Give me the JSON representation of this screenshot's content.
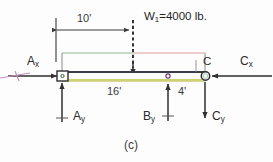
{
  "figure": {
    "caption": "(c)",
    "background_color": "#fdfdfd"
  },
  "dimensions": [
    {
      "id": "span-10",
      "label": "10'",
      "value": 10,
      "unit": "ft",
      "description": "distance from left support A to applied load W1"
    },
    {
      "id": "span-16",
      "label": "16'",
      "value": 16,
      "unit": "ft",
      "description": "distance from left support A to support B"
    },
    {
      "id": "span-4",
      "label": "4'",
      "value": 4,
      "unit": "ft",
      "description": "distance from support B to joint C"
    }
  ],
  "loads": [
    {
      "id": "W1",
      "label": "W",
      "subscript": "1",
      "equals": "=4000 lb.",
      "full_label": "W1=4000 lb.",
      "magnitude": 4000,
      "unit": "lb",
      "direction": "down",
      "line_style": "dashed"
    }
  ],
  "reactions": [
    {
      "id": "Ax",
      "label": "A",
      "subscript": "x",
      "direction": "right",
      "at": "A"
    },
    {
      "id": "Ay",
      "label": "A",
      "subscript": "y",
      "direction": "up",
      "at": "A"
    },
    {
      "id": "By",
      "label": "B",
      "subscript": "y",
      "direction": "up",
      "at": "B"
    },
    {
      "id": "Cx",
      "label": "C",
      "subscript": "x",
      "direction": "left",
      "at": "C"
    },
    {
      "id": "Cy",
      "label": "C",
      "subscript": "y",
      "direction": "down",
      "at": "C"
    }
  ],
  "nodes": [
    {
      "id": "A",
      "label": "",
      "type": "pin-square",
      "x": 62,
      "y": 76
    },
    {
      "id": "B",
      "label": "",
      "type": "pin-dot",
      "x": 168,
      "y": 76
    },
    {
      "id": "C",
      "label": "C",
      "type": "pin-circle",
      "x": 205,
      "y": 76
    }
  ],
  "colors": {
    "beam_top_edge": "#3c3c46",
    "beam_bottom_edge": "#b9c648",
    "outline_left": "#7fb07f",
    "outline_right": "#d98b94",
    "force_line": "#3a3a3a",
    "axis_tick": "#c18fbf",
    "text": "#2b2b2b"
  }
}
